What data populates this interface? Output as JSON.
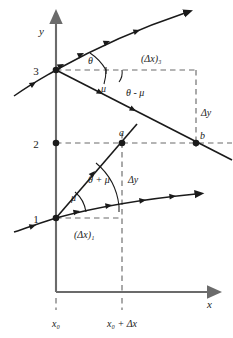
{
  "figure": {
    "kind": "characteristics-diagram",
    "axes": {
      "y_axis_label": "y",
      "x_axis_label": "x"
    },
    "point_labels": {
      "p3": "3",
      "p2": "2",
      "p1": "1",
      "a": "a",
      "b": "b"
    },
    "angle_labels": {
      "theta_top": "θ",
      "mu_top": "μ",
      "theta_minus_mu": "θ - μ",
      "mu_bottom": "μ",
      "theta_plus_mu": "θ + μ"
    },
    "dimension_labels": {
      "dx3": "(Δx)₃",
      "dx1": "(Δx)₁",
      "dy_upper": "Δy",
      "dy_lower": "Δy"
    },
    "x_tick_labels": {
      "x0": "x₀",
      "x0_plus_dx": "x₀ + Δx"
    },
    "colors": {
      "ink": "#1a1a1a",
      "axis": "#6b6b6b",
      "dashed": "#6b6b6b",
      "background": "#ffffff"
    }
  }
}
